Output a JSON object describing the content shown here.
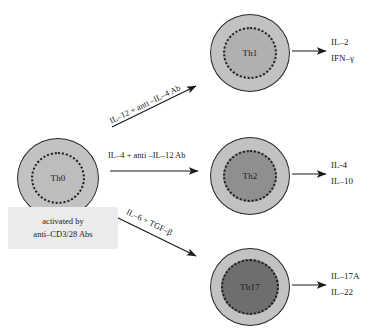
{
  "diagram": {
    "background": "#ffffff",
    "ink": "#1a1a1a"
  },
  "source_cell": {
    "label": "Th0",
    "cytoplasm_color": "#c2c2c2",
    "nucleus_color": "#bdbdbd"
  },
  "activation": {
    "line1": "activated by",
    "line2": "anti–CD3/28 Abs",
    "background": "#ebebeb"
  },
  "pathways": [
    {
      "id": "th1",
      "condition": "IL–12 + anti –IL–4 Ab",
      "cell_label": "Th1",
      "cytoplasm_color": "#c2c2c2",
      "nucleus_color": "#b0b0b0",
      "outputs": [
        "IL–2",
        "IFN–γ"
      ]
    },
    {
      "id": "th2",
      "condition": "IL–4 + anti –IL–12 Ab",
      "cell_label": "Th2",
      "cytoplasm_color": "#c2c2c2",
      "nucleus_color": "#8f8f8f",
      "outputs": [
        "IL-4",
        "IL–10"
      ]
    },
    {
      "id": "th17",
      "condition": "IL–6 + TGF–β",
      "cell_label": "Th17",
      "cytoplasm_color": "#c2c2c2",
      "nucleus_color": "#6e6e6e",
      "outputs": [
        "IL–17A",
        "IL–22"
      ]
    }
  ]
}
